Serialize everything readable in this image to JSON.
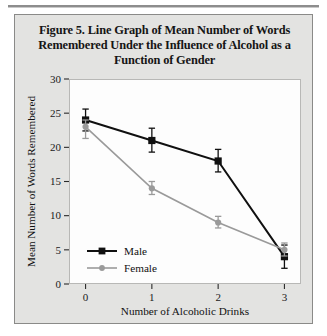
{
  "figure": {
    "title": "Figure 5. Line Graph of Mean Number of Words Remembered Under the Influence of Alcohol as a Function of Gender"
  },
  "chart_data": {
    "type": "line",
    "title": "Figure 5. Line Graph of Mean Number of Words Remembered Under the Influence of Alcohol as a Function of Gender",
    "xlabel": "Number of Alcoholic Drinks",
    "ylabel": "Mean Number of Words Remembered",
    "x": [
      0,
      1,
      2,
      3
    ],
    "xtick_labels": [
      "0",
      "1",
      "2",
      "3"
    ],
    "ytick_labels": [
      "0",
      "5",
      "10",
      "15",
      "20",
      "25",
      "30"
    ],
    "yticks": [
      0,
      5,
      10,
      15,
      20,
      25,
      30
    ],
    "ylim": [
      0,
      30
    ],
    "xlim": [
      -0.25,
      3.25
    ],
    "grid": false,
    "legend_position": "lower-left-inside",
    "series": [
      {
        "name": "Male",
        "color": "#101010",
        "marker": "square",
        "values": [
          24,
          21,
          18,
          4
        ],
        "error_lower": [
          22.4,
          19.3,
          16.4,
          2.3
        ],
        "error_upper": [
          25.6,
          22.8,
          19.7,
          5.7
        ]
      },
      {
        "name": "Female",
        "color": "#9a9a9a",
        "marker": "circle",
        "values": [
          23,
          14,
          9,
          5
        ],
        "error_lower": [
          21.3,
          13.1,
          8.2,
          4.1
        ],
        "error_upper": [
          24.0,
          15.0,
          9.9,
          6.0
        ]
      }
    ]
  },
  "legend": {
    "items": [
      {
        "label": "Male"
      },
      {
        "label": "Female"
      }
    ]
  }
}
